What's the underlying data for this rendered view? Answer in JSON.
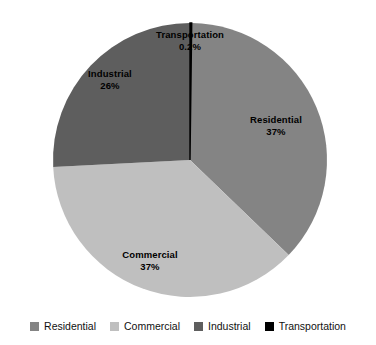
{
  "chart_data": {
    "type": "pie",
    "title": "",
    "subtitle": "",
    "xlabel": "",
    "ylabel": "",
    "categories": [
      "Residential",
      "Commercial",
      "Industrial",
      "Transportation"
    ],
    "values": [
      37,
      37,
      26,
      0.2
    ],
    "value_labels": [
      "37%",
      "37%",
      "26%",
      "0.2%"
    ],
    "colors": [
      "#848484",
      "#bfbfbf",
      "#5e5e5e",
      "#000000"
    ],
    "start_angle_deg": 0,
    "direction": "clockwise",
    "grid": false,
    "legend_position": "bottom",
    "slices": [
      {
        "name": "Residential",
        "value": 37,
        "value_label": "37%",
        "color": "#848484",
        "start_deg": 0.72,
        "end_deg": 133.92,
        "label_x": 276,
        "label_y": 120
      },
      {
        "name": "Commercial",
        "value": 37,
        "value_label": "37%",
        "color": "#bfbfbf",
        "start_deg": 133.92,
        "end_deg": 267.12,
        "label_x": 150,
        "label_y": 255
      },
      {
        "name": "Industrial",
        "value": 26,
        "value_label": "26%",
        "color": "#5e5e5e",
        "start_deg": 267.12,
        "end_deg": 360.0,
        "label_x": 110,
        "label_y": 74
      },
      {
        "name": "Transportation",
        "value": 0.2,
        "value_label": "0.2%",
        "color": "#000000",
        "start_deg": 0.0,
        "end_deg": 0.72,
        "label_x": 190,
        "label_y": 35
      }
    ]
  },
  "labels": {
    "residential": {
      "name": "Residential",
      "value": "37%"
    },
    "commercial": {
      "name": "Commercial",
      "value": "37%"
    },
    "industrial": {
      "name": "Industrial",
      "value": "26%"
    },
    "transportation": {
      "name": "Transportation",
      "value": "0.2%"
    }
  },
  "legend": {
    "items": [
      {
        "label": "Residential",
        "color": "#848484"
      },
      {
        "label": "Commercial",
        "color": "#bfbfbf"
      },
      {
        "label": "Industrial",
        "color": "#5e5e5e"
      },
      {
        "label": "Transportation",
        "color": "#000000"
      }
    ]
  },
  "geometry": {
    "center_x": 190,
    "center_y": 160,
    "radius": 137
  },
  "palette": {
    "background": "#ffffff",
    "text": "#111111",
    "residential": "#848484",
    "commercial": "#bfbfbf",
    "industrial": "#5e5e5e",
    "transportation": "#000000"
  }
}
